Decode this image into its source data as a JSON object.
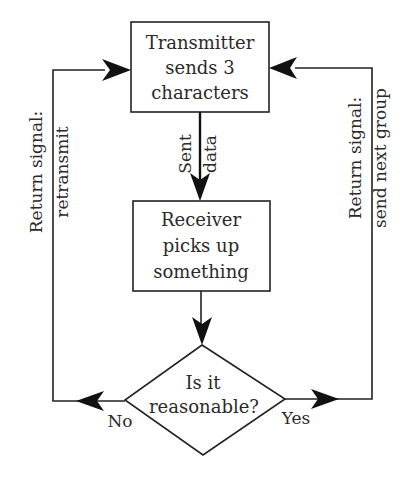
{
  "diagram": {
    "type": "flowchart",
    "nodes": {
      "transmitter": {
        "shape": "rectangle",
        "lines": [
          "Transmitter",
          "sends 3",
          "characters"
        ]
      },
      "receiver": {
        "shape": "rectangle",
        "lines": [
          "Receiver",
          "picks up",
          "something"
        ]
      },
      "decision": {
        "shape": "diamond",
        "lines": [
          "Is it",
          "reasonable?"
        ]
      }
    },
    "edges": {
      "sent_data": {
        "from": "transmitter",
        "to": "receiver",
        "label_lines": [
          "Sent",
          "data"
        ]
      },
      "to_decision": {
        "from": "receiver",
        "to": "decision"
      },
      "no_branch": {
        "from": "decision",
        "to": "transmitter",
        "branch_label": "No",
        "label_lines": [
          "Return signal:",
          "retransmit"
        ]
      },
      "yes_branch": {
        "from": "decision",
        "to": "transmitter",
        "branch_label": "Yes",
        "label_lines": [
          "Return signal:",
          "send next group"
        ]
      }
    }
  },
  "colors": {
    "line": "#222222",
    "text": "#2a2a2a",
    "background": "#ffffff"
  }
}
